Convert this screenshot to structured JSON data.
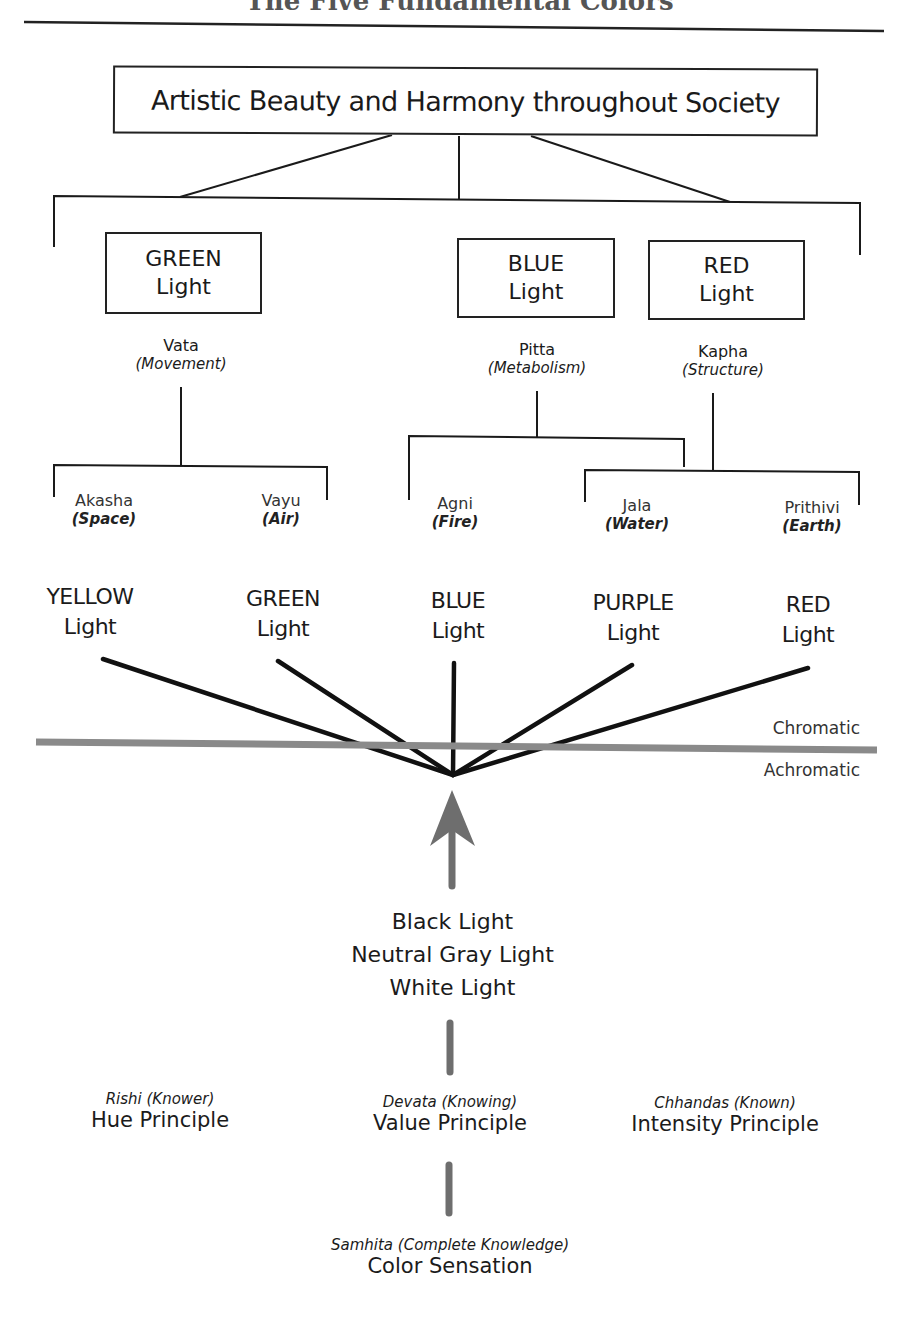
{
  "header": {
    "title": "The Five Fundamental Colors"
  },
  "top_box": {
    "label": "Artistic Beauty and Harmony throughout Society"
  },
  "primary_lights": [
    {
      "color": "GREEN",
      "suffix": "Light",
      "dosha": "Vata",
      "quality": "(Movement)"
    },
    {
      "color": "BLUE",
      "suffix": "Light",
      "dosha": "Pitta",
      "quality": "(Metabolism)"
    },
    {
      "color": "RED",
      "suffix": "Light",
      "dosha": "Kapha",
      "quality": "(Structure)"
    }
  ],
  "elements": [
    {
      "name": "Akasha",
      "meaning": "(Space)"
    },
    {
      "name": "Vayu",
      "meaning": "(Air)"
    },
    {
      "name": "Agni",
      "meaning": "(Fire)"
    },
    {
      "name": "Jala",
      "meaning": "(Water)"
    },
    {
      "name": "Prithivi",
      "meaning": "(Earth)"
    }
  ],
  "fundamental_colors": [
    {
      "color": "YELLOW",
      "suffix": "Light"
    },
    {
      "color": "GREEN",
      "suffix": "Light"
    },
    {
      "color": "BLUE",
      "suffix": "Light"
    },
    {
      "color": "PURPLE",
      "suffix": "Light"
    },
    {
      "color": "RED",
      "suffix": "Light"
    }
  ],
  "divider": {
    "above_label": "Chromatic",
    "below_label": "Achromatic",
    "band_color": "#8a8a8a"
  },
  "achromatic_lights": {
    "line1": "Black Light",
    "line2": "Neutral Gray Light",
    "line3": "White Light"
  },
  "principles": [
    {
      "sub": "Rishi (Knower)",
      "name": "Hue Principle"
    },
    {
      "sub": "Devata (Knowing)",
      "name": "Value Principle"
    },
    {
      "sub": "Chhandas (Known)",
      "name": "Intensity Principle"
    }
  ],
  "sensation": {
    "sub": "Samhita (Complete Knowledge)",
    "name": "Color Sensation"
  },
  "colors": {
    "line": "#1a1a1a",
    "arrow": "#6e6e6e"
  }
}
